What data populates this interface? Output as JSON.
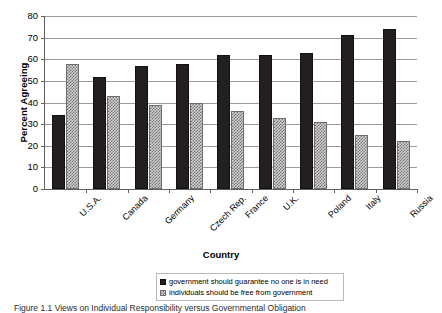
{
  "chart_data": {
    "type": "bar",
    "title": "",
    "xlabel": "Country",
    "ylabel": "Percent Agreeing",
    "categories": [
      "U.S.A.",
      "Canada",
      "Germany",
      "Czech Rep.",
      "France",
      "U.K.",
      "Poland",
      "Italy",
      "Russia"
    ],
    "series": [
      {
        "name": "government should guarantee no one is in need",
        "values": [
          34,
          52,
          57,
          58,
          62,
          62,
          63,
          71,
          74
        ],
        "color": "#231f20",
        "pattern": "solid"
      },
      {
        "name": "individuals should be free from government",
        "values": [
          58,
          43,
          39,
          40,
          36,
          33,
          31,
          25,
          22
        ],
        "color": "#d3d3d3",
        "pattern": "checkered"
      }
    ],
    "ylim": [
      0,
      80
    ],
    "ytick_step": 10,
    "yticks": [
      0,
      10,
      20,
      30,
      40,
      50,
      60,
      70,
      80
    ],
    "grid": true,
    "grid_axis": "y",
    "legend_position": "bottom-center"
  },
  "axes": {
    "y_title": "Percent Agreeing",
    "x_title": "Country"
  },
  "legend": {
    "entries": [
      {
        "swatch": "solid-black-swatch",
        "label": "government should guarantee no one is in need"
      },
      {
        "swatch": "checkered-gray-swatch",
        "label": "individuals should be free from government"
      }
    ]
  },
  "caption": {
    "text": "Figure 1.1    Views on Individual Responsibility versus Governmental Obligation"
  }
}
